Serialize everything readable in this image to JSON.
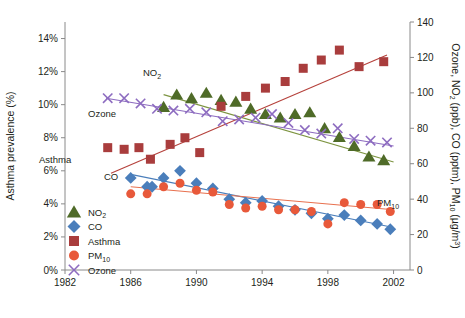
{
  "chart_data": {
    "type": "scatter",
    "title": "",
    "xlabel": "",
    "ylabel": "Asthma prevalence (%)",
    "y2label": "Ozone, NO2 (ppb), CO (pptm), PM10 (µg/m³)",
    "xlim": [
      1982,
      2003
    ],
    "ylim": [
      0,
      15
    ],
    "y2lim": [
      0,
      140
    ],
    "grid": false,
    "legend_position": "inside-lower-left",
    "xticks": [
      1982,
      1986,
      1990,
      1994,
      1998,
      2002
    ],
    "xticklabels": [
      "1982",
      "1986",
      "1990",
      "1994",
      "1998",
      "2002"
    ],
    "yticks": [
      0,
      2,
      4,
      6,
      8,
      10,
      12,
      14
    ],
    "yticklabels": [
      "0%",
      "2%",
      "4%",
      "6%",
      "8%",
      "10%",
      "12%",
      "14%"
    ],
    "y2ticks": [
      0,
      20,
      40,
      60,
      80,
      100,
      120,
      140
    ],
    "y2ticklabels": [
      "0",
      "20",
      "40",
      "60",
      "80",
      "100",
      "120",
      "140"
    ],
    "series": [
      {
        "name": "NO2",
        "axis": "right",
        "marker": "triangle",
        "color": "#4f6b28",
        "inplot_label": "NO2",
        "trend": {
          "x0": 1988.0,
          "y0": 99.0,
          "x1": 2002.0,
          "y1": 61.0,
          "color": "#7d9440"
        },
        "x": [
          1988.0,
          1988.8,
          1989.7,
          1990.6,
          1991.5,
          1992.4,
          1993.3,
          1994.2,
          1995.1,
          1996.0,
          1996.9,
          1997.8,
          1998.7,
          1999.6,
          2000.5,
          2001.4
        ],
        "y": [
          92.0,
          99.0,
          97.0,
          100.0,
          96.0,
          95.0,
          91.0,
          88.0,
          86.0,
          88.0,
          89.0,
          80.0,
          75.0,
          70.0,
          64.0,
          62.0
        ]
      },
      {
        "name": "CO",
        "axis": "right",
        "marker": "diamond",
        "color": "#4a7ebb",
        "inplot_label": "CO",
        "trend": {
          "x0": 1986.0,
          "y0": 54.0,
          "x1": 2002.0,
          "y1": 24.0,
          "color": "#4a7ebb"
        },
        "x": [
          1986.0,
          1987.0,
          1987.3,
          1988.0,
          1989.0,
          1990.0,
          1991.0,
          1992.0,
          1993.0,
          1994.0,
          1995.0,
          1996.0,
          1997.0,
          1998.0,
          1999.0,
          2000.0,
          2001.0,
          2001.8
        ],
        "y": [
          52.0,
          47.0,
          47.0,
          52.0,
          56.0,
          49.0,
          46.0,
          40.0,
          38.0,
          39.0,
          36.0,
          34.0,
          32.0,
          29.0,
          31.0,
          28.0,
          26.0,
          23.0
        ]
      },
      {
        "name": "Asthma",
        "axis": "left",
        "marker": "square",
        "color": "#a93d3d",
        "inplot_label": "Asthma",
        "trend": {
          "x0": 1984.8,
          "y0": 5.85,
          "x1": 2001.6,
          "y1": 13.0,
          "color": "#b5413b"
        },
        "x": [
          1984.6,
          1985.6,
          1986.5,
          1987.2,
          1988.4,
          1989.3,
          1990.2,
          1991.5,
          1993.0,
          1994.2,
          1995.4,
          1996.5,
          1997.6,
          1998.7,
          1999.9,
          2001.4
        ],
        "y": [
          7.4,
          7.3,
          7.4,
          6.7,
          7.6,
          8.0,
          7.1,
          9.9,
          10.5,
          11.0,
          11.4,
          12.2,
          12.7,
          13.3,
          12.3,
          12.6
        ]
      },
      {
        "name": "PM10",
        "axis": "right",
        "marker": "circle",
        "color": "#e8593a",
        "inplot_label": "PM10",
        "trend": {
          "x0": 1986.0,
          "y0": 47.0,
          "x1": 2002.0,
          "y1": 34.0,
          "color": "#e8714f"
        },
        "x": [
          1986.0,
          1987.0,
          1988.0,
          1989.0,
          1990.0,
          1991.0,
          1992.0,
          1993.0,
          1994.0,
          1995.0,
          1996.0,
          1997.0,
          1998.0,
          1999.0,
          2000.0,
          2001.0,
          2001.8
        ],
        "y": [
          43.0,
          43.0,
          47.0,
          49.0,
          45.0,
          44.0,
          37.0,
          35.0,
          36.0,
          34.0,
          34.0,
          33.0,
          26.0,
          38.0,
          37.0,
          37.0,
          33.0
        ]
      },
      {
        "name": "Ozone",
        "axis": "right",
        "marker": "x",
        "color": "#8d6cc0",
        "inplot_label": "Ozone",
        "trend": {
          "x0": 1984.5,
          "y0": 97.0,
          "x1": 2002.0,
          "y1": 70.0,
          "color": "#8d6cc0"
        },
        "x": [
          1984.6,
          1985.6,
          1986.6,
          1987.6,
          1988.6,
          1989.6,
          1990.6,
          1991.6,
          1992.6,
          1993.6,
          1994.6,
          1995.6,
          1996.6,
          1997.6,
          1998.6,
          1999.6,
          2000.6,
          2001.6
        ],
        "y": [
          97.0,
          97.0,
          94.0,
          91.0,
          90.0,
          91.0,
          89.0,
          84.0,
          85.0,
          86.0,
          88.0,
          83.0,
          79.0,
          77.0,
          80.0,
          74.0,
          73.0,
          72.0
        ]
      }
    ],
    "legend": [
      {
        "label": "NO2",
        "marker": "triangle",
        "color": "#4f6b28"
      },
      {
        "label": "CO",
        "marker": "diamond",
        "color": "#4a7ebb"
      },
      {
        "label": "Asthma",
        "marker": "square",
        "color": "#a93d3d"
      },
      {
        "label": "PM10",
        "marker": "circle",
        "color": "#e8593a"
      },
      {
        "label": "Ozone",
        "marker": "x",
        "color": "#8d6cc0"
      }
    ]
  },
  "labels": {
    "y_axis_title": "Asthma prevalence (%)",
    "y2_axis_title_parts": [
      "Ozone, NO",
      "2",
      " (ppb), CO (pptm), PM",
      "10",
      " (µg/m",
      "3",
      ")"
    ],
    "no2_label_base": "NO",
    "no2_label_sub": "2",
    "co_label": "CO",
    "asthma_label": "Asthma",
    "ozone_label": "Ozone",
    "pm10_label_base": "PM",
    "pm10_label_sub": "10"
  },
  "caption": {
    "text": ""
  }
}
